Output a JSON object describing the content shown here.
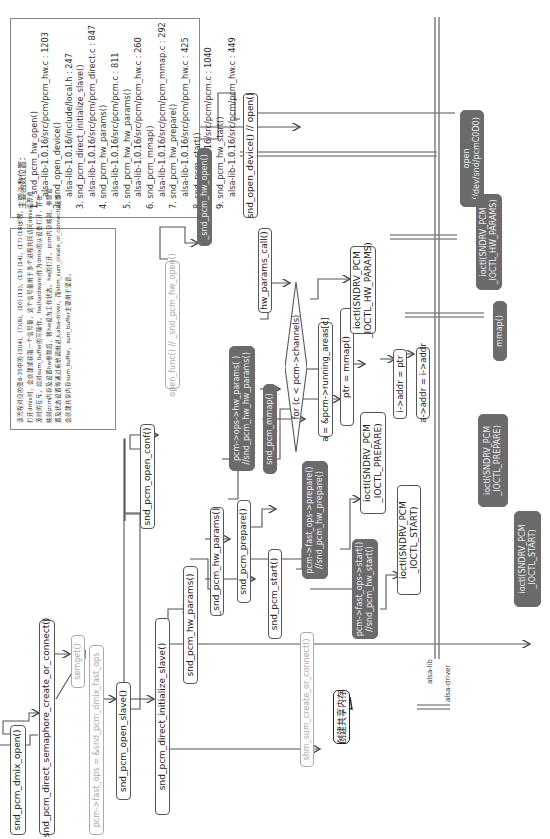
{
  "legend": {
    "title": "主要函数位置：",
    "items": [
      {
        "func": "1. _snd_pcm_hw_open()",
        "loc": "alsa-lib-1.0.16/src/pcm/pcm_hw.c : 1203"
      },
      {
        "func": "2. snd_open_device()",
        "loc": "alsa-lib-1.0.16/include/local.h : 247"
      },
      {
        "func": "3. snd_pcm_direct_initialize_slave()",
        "loc": "alsa-lib-1.0.16/src/pcm/pcm_direct.c : 847"
      },
      {
        "func": "4. snd_pcm_hw_params()",
        "loc": "alsa-lib-1.0.16/src/pcm/pcm.c : 811"
      },
      {
        "func": "5. snd_pcm_hw_hw_params()",
        "loc": "alsa-lib-1.0.16/src/pcm/pcm_hw.c : 260"
      },
      {
        "func": "6. snd_pcm_mmap()",
        "loc": "alsa-lib-1.0.16/src/pcm/pcm_mmap.c : 292"
      },
      {
        "func": "7. snd_pcm_hw_prepare()",
        "loc": "alsa-lib-1.0.16/src/pcm/pcm_hw.c : 425"
      },
      {
        "func": "8. snd_pcm_start()",
        "loc": "alsa-lib-1.0.16/src/pcm/pcm.c : 1040"
      },
      {
        "func": "9. snd_pcm_hw_start()",
        "loc": "alsa-lib-1.0.16/src/pcm/pcm_hw.c : 449"
      }
    ]
  },
  "description": {
    "lines": [
      "该流程对应的图8-35中的 (3)(4)、(7)(8)、(10) (11)、(13) (14)、(17) (18)步骤。",
      "打开dmix时，会创建或获取一个信号量，这个信号量用于多个进程共同访问dmix临界资",
      "源时的互斥，如对sum_buffer的写操作。hw(hardware)作为dmix的从设备打开，并在",
      "映射pcm内存及设置hw参数后，将hw设为工作状态。hw的打开、pcm内存映射、参数设",
      "置及状态设置等通过系统调用进入alsa-driver。而shm_sum_create_or_connect()函数",
      "会创建共享内存sum_buffer，sum_buffer主要用于混音。"
    ]
  },
  "nodes": {
    "dmix_open": "snd_pcm_dmix_open()",
    "semaphore": "snd_pcm_direct_semaphore_create_or_connect()",
    "semget": "semget()",
    "fast_ops": "pcm->fast_ops = &snd_pcm_dmix_fast_ops",
    "open_slave": "snd_pcm_open_slave()",
    "open_conf": "snd_pcm_open_conf()",
    "open_func": "open_func() // _snd_pcm_hw_open()",
    "hw_open": "_snd_pcm_hw_open()",
    "open_device": "snd_open_device() // open()",
    "init_slave": "snd_pcm_direct_initialize_slave()",
    "hw_params1": "snd_pcm_hw_params()",
    "hw_params2": "_snd_pcm_hw_params()",
    "ops_hw_params_1": "pcm->ops->hw_params( )",
    "ops_hw_params_2": "//snd_pcm_hw_hw_params()",
    "hw_params_call": "hw_params_call()",
    "ioctl_hw_params_1": "ioctl(SNDRV_PCM",
    "ioctl_hw_params_2": "_IOCTL_HW_PARAMS)",
    "pcm_mmap": "snd_pcm_mmap()",
    "for_loop": "for (c < pcm->channels)",
    "running_areas": "a = &pcm->running_areas[c]",
    "ptr_mmap": "ptr = mmap()",
    "i_addr": "i->addr = ptr",
    "a_addr": "a->addr = i->addr",
    "pcm_prepare": "snd_pcm_prepare()",
    "ops_prepare_1": "pcm->fast_ops->prepare()",
    "ops_prepare_2": "//snd_pcm_hw_prepare()",
    "ioctl_prepare_1": "ioctl(SNDRV_PCM",
    "ioctl_prepare_2": "_IOCTL_PREPARE)",
    "pcm_start": "snd_pcm_start()",
    "ops_start_1": "pcm->fast_ops->start()",
    "ops_start_2": "//snd_pcm_hw_start()",
    "ioctl_start_1": "ioctl(SNDRV_PCM",
    "ioctl_start_2": "_IOCTL_START)",
    "shm_sum": "shm_sum_create_or_connect()",
    "callout": "创建共享内存"
  },
  "driver_nodes": {
    "open_1": "open",
    "open_2": "(/dev/snd/pcmC0D0)",
    "hw_params_1": "ioctl(SNDRV_PCM",
    "hw_params_2": "_IOCTL_HW_PARAMS)",
    "mmap": "mmap()",
    "prepare_1": "ioctl(SNDRV_PCM",
    "prepare_2": "_IOCTL_PREPARE)",
    "start_1": "ioctl(SNDRV_PCM",
    "start_2": "_IOCTL_START)"
  },
  "boundary": {
    "lib_label": "alsa-lib",
    "driver_label": "alsa-driver"
  },
  "colors": {
    "dark_box": "#6b6b6b",
    "line": "#555555",
    "gray_text": "#aaaaaa"
  }
}
